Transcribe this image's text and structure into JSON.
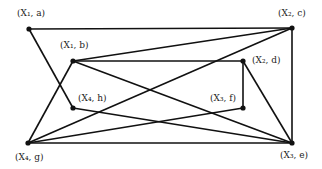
{
  "diagram": {
    "nodes": [
      {
        "id": "a",
        "label": "(X₁, a)",
        "x": 29,
        "y": 29,
        "lx": 17,
        "ly": 16
      },
      {
        "id": "c",
        "label": "(X₂, c)",
        "x": 292,
        "y": 28,
        "lx": 278,
        "ly": 16
      },
      {
        "id": "b",
        "label": "(X₁, b)",
        "x": 73,
        "y": 61,
        "lx": 60,
        "ly": 48
      },
      {
        "id": "d",
        "label": "(X₂, d)",
        "x": 243,
        "y": 61,
        "lx": 252,
        "ly": 63
      },
      {
        "id": "h",
        "label": "(X₄, h)",
        "x": 73,
        "y": 108,
        "lx": 78,
        "ly": 101
      },
      {
        "id": "f",
        "label": "(X₃, f)",
        "x": 243,
        "y": 108,
        "lx": 210,
        "ly": 101
      },
      {
        "id": "g",
        "label": "(X₄, g)",
        "x": 28,
        "y": 143,
        "lx": 15,
        "ly": 160
      },
      {
        "id": "e",
        "label": "(X₃, e)",
        "x": 292,
        "y": 143,
        "lx": 280,
        "ly": 158
      }
    ],
    "edges": [
      [
        "a",
        "c"
      ],
      [
        "a",
        "h"
      ],
      [
        "b",
        "c"
      ],
      [
        "b",
        "d"
      ],
      [
        "b",
        "e"
      ],
      [
        "b",
        "g"
      ],
      [
        "c",
        "e"
      ],
      [
        "c",
        "g"
      ],
      [
        "d",
        "f"
      ],
      [
        "d",
        "e"
      ],
      [
        "h",
        "e"
      ],
      [
        "f",
        "g"
      ],
      [
        "g",
        "e"
      ]
    ]
  }
}
